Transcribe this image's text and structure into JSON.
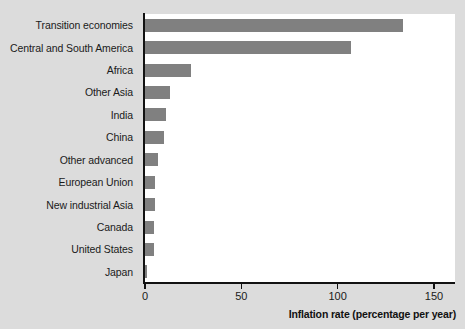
{
  "chart_data": {
    "type": "bar",
    "orientation": "horizontal",
    "title": "",
    "xlabel": "Inflation rate (percentage per year)",
    "ylabel": "",
    "xlim": [
      0,
      155
    ],
    "xticks": [
      0,
      50,
      100,
      150
    ],
    "xtick_labels": [
      "0",
      "50",
      "100",
      "150"
    ],
    "grid": false,
    "legend": false,
    "bar_color": "#808080",
    "plot_background": "#ffffff",
    "figure_background": "#dcdcdc",
    "axis_color": "#121212",
    "categories": [
      "Transition economies",
      "Central and South America",
      "Africa",
      "Other Asia",
      "India",
      "China",
      "Other advanced",
      "European Union",
      "New industrial Asia",
      "Canada",
      "United States",
      "Japan"
    ],
    "values": [
      134,
      107,
      24,
      13,
      11,
      10,
      7,
      5,
      5,
      4.5,
      4.5,
      1
    ]
  }
}
